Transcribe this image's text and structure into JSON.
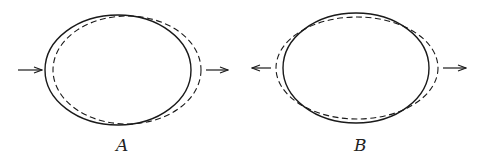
{
  "figures": [
    {
      "label": "A",
      "solid_ellipse": {
        "cx": 118,
        "cy": 70,
        "rx": 73,
        "ry": 55
      },
      "dashed_ellipse": {
        "cx": 127,
        "cy": 70,
        "rx": 74,
        "ry": 54
      },
      "arrows": [
        {
          "name": "left-arrow",
          "x1": 18,
          "x2": 42,
          "y": 70,
          "direction": "right"
        },
        {
          "name": "right-arrow",
          "x1": 206,
          "x2": 228,
          "y": 70,
          "direction": "right"
        }
      ]
    },
    {
      "label": "B",
      "solid_ellipse": {
        "cx": 356,
        "cy": 68,
        "rx": 73,
        "ry": 55
      },
      "dashed_ellipse": {
        "cx": 357,
        "cy": 68,
        "rx": 81,
        "ry": 51
      },
      "arrows": [
        {
          "name": "left-arrow",
          "x1": 271,
          "x2": 252,
          "y": 68,
          "direction": "left"
        },
        {
          "name": "right-arrow",
          "x1": 443,
          "x2": 466,
          "y": 68,
          "direction": "right"
        }
      ]
    }
  ],
  "colors": {
    "stroke": "#1a1a1a",
    "background": "#ffffff"
  }
}
